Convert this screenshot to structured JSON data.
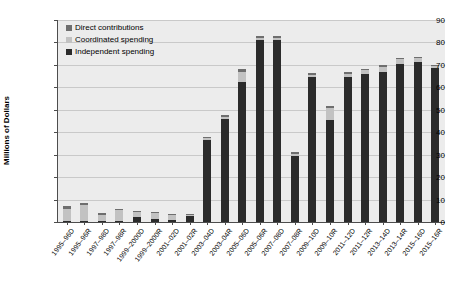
{
  "chart": {
    "type": "bar",
    "ylabel": "Millions of Dollars"
  },
  "legend": {
    "position": "top-left",
    "items": [
      {
        "label": "Direct contributions",
        "color": "#6e6e6e",
        "swatch_name": "legend-swatch-direct-contributions"
      },
      {
        "label": "Coordinated spending",
        "color": "#c2c2c2",
        "swatch_name": "legend-swatch-coordinated-spending"
      },
      {
        "label": "Independent spending",
        "color": "#2b2b2b",
        "swatch_name": "legend-swatch-independent-spending"
      }
    ]
  },
  "yaxis": {
    "ticks": [
      "0",
      "10",
      "20",
      "30",
      "40",
      "50",
      "60",
      "70",
      "80",
      "90"
    ],
    "min": 0,
    "max": 90,
    "step": 10
  },
  "chart_data": {
    "type": "bar",
    "stacked": true,
    "title": "",
    "xlabel": "",
    "ylabel": "Millions of Dollars",
    "ylim": [
      0,
      90
    ],
    "ytick_step": 10,
    "grid": true,
    "legend_position": "top-left",
    "categories": [
      "1995–96D",
      "1995–96R",
      "1997–98D",
      "1997–98R",
      "1999–2000D",
      "1999–2000R",
      "2001–02D",
      "2001–02R",
      "2003–04D",
      "2003–04R",
      "2005–06D",
      "2005–06R",
      "2007–08D",
      "2007–08R",
      "2009–10D",
      "2009–10R",
      "2011–12D",
      "2011–12R",
      "2013–14D",
      "2013–14R",
      "2015–16D",
      "2015–16R"
    ],
    "series": [
      {
        "name": "Independent spending",
        "color": "#2b2b2b",
        "values": [
          0.3,
          0.3,
          0.1,
          0.2,
          2.3,
          1.4,
          0.9,
          2.6,
          36.5,
          46.0,
          62.5,
          81.0,
          81.0,
          29.5,
          64.5,
          45.5,
          64.5,
          66.0,
          67.0,
          70.5,
          71.5,
          68.5
        ]
      },
      {
        "name": "Coordinated spending",
        "color": "#c2c2c2",
        "values": [
          5.7,
          7.2,
          3.0,
          5.1,
          2.2,
          2.7,
          2.1,
          0.5,
          0.8,
          0.6,
          4.5,
          1.2,
          1.2,
          1.0,
          1.0,
          5.5,
          1.5,
          1.6,
          2.2,
          2.0,
          1.4,
          1.0
        ]
      },
      {
        "name": "Direct contributions",
        "color": "#6e6e6e",
        "values": [
          1.0,
          1.1,
          0.5,
          0.6,
          0.6,
          0.5,
          0.6,
          0.5,
          0.7,
          0.9,
          1.0,
          0.8,
          0.8,
          0.7,
          0.7,
          0.9,
          0.7,
          0.6,
          0.7,
          0.7,
          0.7,
          0.6
        ]
      }
    ],
    "totals": [
      7.0,
      8.6,
      3.6,
      5.9,
      5.1,
      4.6,
      3.6,
      3.6,
      38.0,
      47.5,
      68.0,
      83.0,
      83.0,
      31.2,
      66.2,
      51.9,
      66.7,
      68.2,
      69.9,
      73.2,
      73.6,
      70.1
    ]
  }
}
